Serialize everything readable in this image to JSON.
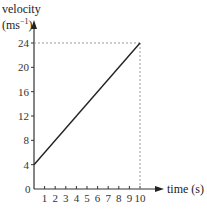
{
  "chart_data": {
    "type": "line",
    "title": "",
    "xlabel": "time (s)",
    "ylabel_line1": "velocity",
    "ylabel_line2": "(ms",
    "ylabel_sup": "−1",
    "ylabel_close": ")",
    "x": [
      0,
      10
    ],
    "series": [
      {
        "name": "velocity",
        "x": [
          0,
          10
        ],
        "y": [
          4,
          24
        ]
      }
    ],
    "xlim": [
      0,
      10
    ],
    "ylim": [
      0,
      24
    ],
    "xticks": [
      "1",
      "2",
      "3",
      "4",
      "5",
      "6",
      "7",
      "8",
      "9",
      "10"
    ],
    "yticks": [
      "0",
      "4",
      "8",
      "12",
      "16",
      "20",
      "24"
    ],
    "origin_label": "0",
    "grid": false,
    "legend": "none",
    "annotations": [
      {
        "type": "dashed-guide",
        "from": [
          0,
          24
        ],
        "to": [
          10,
          24
        ]
      },
      {
        "type": "dashed-guide",
        "from": [
          10,
          0
        ],
        "to": [
          10,
          24
        ]
      }
    ],
    "colors": {
      "line": "#222222",
      "axis": "#333333",
      "guide": "#999999"
    }
  }
}
